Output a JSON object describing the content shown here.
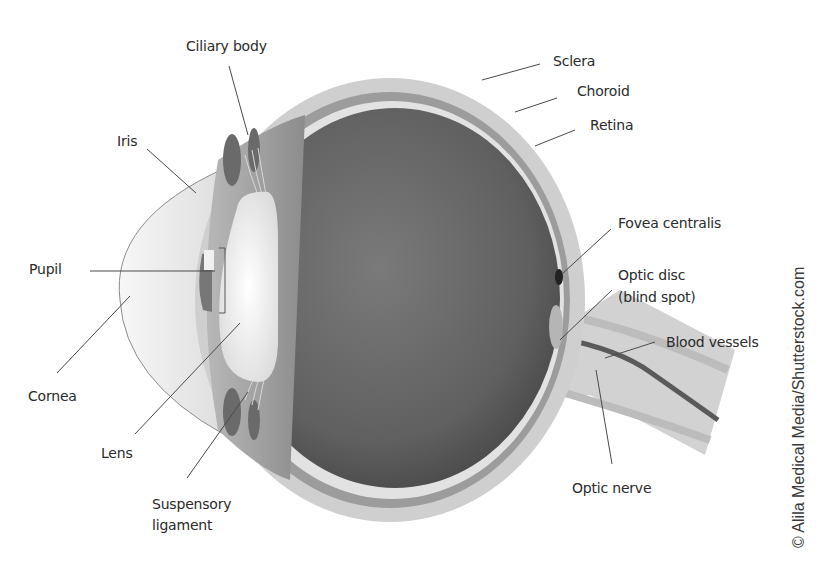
{
  "diagram": {
    "labels": {
      "ciliary_body": "Ciliary body",
      "iris": "Iris",
      "pupil": "Pupil",
      "cornea": "Cornea",
      "lens": "Lens",
      "suspensory_ligament_line1": "Suspensory",
      "suspensory_ligament_line2": "ligament",
      "sclera": "Sclera",
      "choroid": "Choroid",
      "retina": "Retina",
      "fovea_centralis": "Fovea centralis",
      "optic_disc_line1": "Optic disc",
      "optic_disc_line2": "(blind spot)",
      "blood_vessels": "Blood vessels",
      "optic_nerve": "Optic nerve"
    },
    "credit": "© Alila Medical Media/Shutterstock.com",
    "colors": {
      "background": "#ffffff",
      "sclera": "#cfcfcf",
      "choroid": "#9c9c9c",
      "retina": "#e2e2e2",
      "vitreous_center": "#6e6e6e",
      "vitreous_edge": "#4a4a4a",
      "lens": "#eeeeee",
      "leader_line": "#4a4a4a",
      "text": "#2a2a2a"
    }
  }
}
